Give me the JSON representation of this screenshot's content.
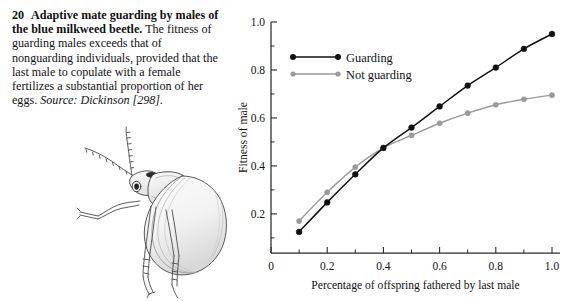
{
  "figure": {
    "number": "20",
    "title": "Adaptive mate guarding by males of the blue milkweed beetle.",
    "body": "The fitness of guarding males exceeds that of nonguarding individuals, provided that the last male to copulate with a female fertilizes a substantial proportion of her eggs.",
    "source_label": "Source:",
    "source_citation": "Dickinson [298].",
    "illustration_name": "blue milkweed beetle line drawing"
  },
  "chart_data": {
    "type": "line",
    "title": "",
    "xlabel": "Percentage of offspring fathered by last male",
    "ylabel": "Fitness of male",
    "xlim": [
      0,
      1.05
    ],
    "ylim": [
      0.037,
      1.0
    ],
    "xticks": [
      0,
      0.2,
      0.4,
      0.6,
      0.8,
      1.0
    ],
    "xtick_labels": [
      "0",
      "0.2",
      "0.4",
      "0.6",
      "0.8",
      "1.0"
    ],
    "xminor_ticks": [
      0.1,
      0.3,
      0.5,
      0.7,
      0.9
    ],
    "yticks": [
      0.2,
      0.4,
      0.6,
      0.8,
      1.0
    ],
    "ytick_labels": [
      "0.2",
      "0.4",
      "0.6",
      "0.8",
      "1.0"
    ],
    "yminor_ticks": [
      0.1,
      0.3,
      0.5,
      0.7,
      0.9
    ],
    "grid": false,
    "legend_position": "upper left",
    "x": [
      0.1,
      0.2,
      0.3,
      0.4,
      0.5,
      0.6,
      0.7,
      0.8,
      0.9,
      1.0
    ],
    "series": [
      {
        "name": "Guarding",
        "color": "#111111",
        "marker": "circle",
        "values": [
          0.125,
          0.248,
          0.365,
          0.475,
          0.56,
          0.648,
          0.735,
          0.81,
          0.888,
          0.95
        ]
      },
      {
        "name": "Not guarding",
        "color": "#9a9a9a",
        "marker": "circle",
        "values": [
          0.17,
          0.29,
          0.395,
          0.475,
          0.527,
          0.578,
          0.62,
          0.655,
          0.678,
          0.695
        ]
      }
    ]
  }
}
